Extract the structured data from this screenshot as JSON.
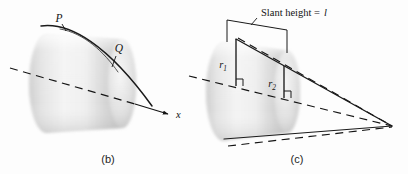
{
  "figure": {
    "background_color": "#fdfdfd",
    "ink_color": "#141414",
    "surface_light": "#f2f2f2",
    "surface_mid": "#dcdcdc",
    "surface_dark": "#b9b9b9",
    "panels": [
      {
        "id": "b",
        "caption": "(b)",
        "labels": {
          "point_p": "P",
          "point_q": "Q",
          "axis": "x"
        }
      },
      {
        "id": "c",
        "caption": "(c)",
        "labels": {
          "slant_height": "Slant height =",
          "slant_height_symbol": "l",
          "radius_1": "r",
          "radius_1_sub": "1",
          "radius_2": "r",
          "radius_2_sub": "2"
        }
      }
    ]
  }
}
